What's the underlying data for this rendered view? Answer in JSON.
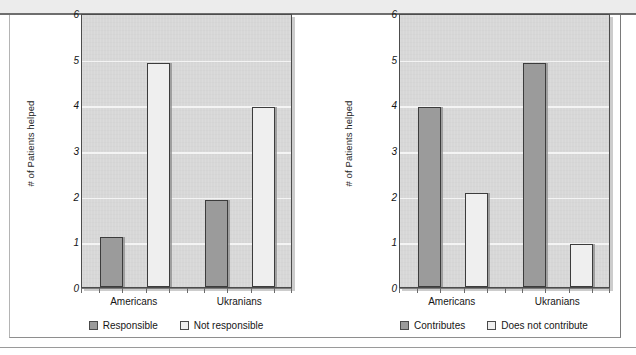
{
  "page": {
    "background_color": "#ffffff",
    "top_band_color": "#ecececec",
    "frame_border_color": "#8e8e8e"
  },
  "style": {
    "plot_background": "#d7d7d7",
    "gridline_color": "#f4f4f4",
    "axis_color": "#4c4c4c",
    "bar_dark_color": "#9b9b9b",
    "bar_light_color": "#efefef",
    "bar_outline_color": "#3c3c3c",
    "text_color": "#161616"
  },
  "chart_data": [
    {
      "id": "responsibility-chart",
      "type": "bar",
      "title": "",
      "xlabel": "",
      "ylabel": "# of Patients helped",
      "categories": [
        "Americans",
        "Ukranians"
      ],
      "ylim": [
        0,
        6
      ],
      "yticks": [
        0,
        1,
        2,
        3,
        4,
        5,
        6
      ],
      "grid": true,
      "legend_position": "bottom",
      "series": [
        {
          "name": "Responsible",
          "color": "#9b9b9b",
          "values": [
            1.1,
            1.9
          ]
        },
        {
          "name": "Not responsible",
          "color": "#efefef",
          "values": [
            4.9,
            3.95
          ]
        }
      ]
    },
    {
      "id": "contribution-chart",
      "type": "bar",
      "title": "",
      "xlabel": "",
      "ylabel": "# of Patients helped",
      "categories": [
        "Americans",
        "Ukranians"
      ],
      "ylim": [
        0,
        6
      ],
      "yticks": [
        0,
        1,
        2,
        3,
        4,
        5,
        6
      ],
      "grid": true,
      "legend_position": "bottom",
      "series": [
        {
          "name": "Contributes",
          "color": "#9b9b9b",
          "values": [
            3.95,
            4.9
          ]
        },
        {
          "name": "Does not contribute",
          "color": "#efefef",
          "values": [
            2.05,
            0.95
          ]
        }
      ]
    }
  ]
}
